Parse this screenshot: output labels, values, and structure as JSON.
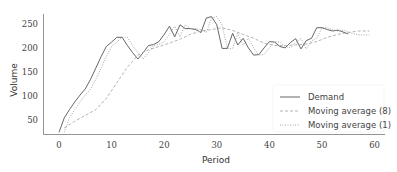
{
  "chart_data": {
    "type": "line",
    "title": "",
    "xlabel": "Period",
    "ylabel": "Volume",
    "xlim": [
      -2,
      62
    ],
    "ylim": [
      15,
      270
    ],
    "xticks": [
      0,
      10,
      20,
      30,
      40,
      50,
      60
    ],
    "yticks": [
      50,
      100,
      150,
      200,
      250
    ],
    "grid": false,
    "legend_position": "lower right",
    "series": [
      {
        "name": "Demand",
        "style": "solid",
        "color": "#555555",
        "x": [
          0,
          1,
          2,
          3,
          4,
          5,
          6,
          7,
          8,
          9,
          10,
          11,
          12,
          13,
          14,
          15,
          16,
          17,
          18,
          19,
          20,
          21,
          22,
          23,
          24,
          25,
          26,
          27,
          28,
          29,
          30,
          31,
          32,
          33,
          34,
          35,
          36,
          37,
          38,
          39,
          40,
          41,
          42,
          43,
          44,
          45,
          46,
          47,
          48,
          49,
          50,
          51,
          52,
          53,
          54,
          55
        ],
        "values": [
          25,
          55,
          72,
          88,
          102,
          115,
          135,
          158,
          182,
          203,
          212,
          222,
          222,
          205,
          190,
          177,
          190,
          205,
          207,
          213,
          228,
          245,
          223,
          248,
          240,
          240,
          238,
          232,
          262,
          265,
          248,
          199,
          199,
          230,
          206,
          220,
          200,
          185,
          186,
          200,
          213,
          212,
          203,
          200,
          211,
          219,
          198,
          215,
          220,
          242,
          242,
          238,
          235,
          237,
          233,
          229
        ]
      },
      {
        "name": "Moving average (8)",
        "style": "dashed",
        "color": "#aaaaaa",
        "x": [
          1,
          3,
          5,
          7,
          9,
          11,
          13,
          15,
          17,
          19,
          21,
          23,
          25,
          27,
          29,
          31,
          33,
          35,
          37,
          39,
          41,
          43,
          45,
          47,
          49,
          51,
          53,
          55,
          57,
          59
        ],
        "values": [
          34,
          48,
          60,
          72,
          95,
          128,
          160,
          185,
          196,
          203,
          210,
          218,
          228,
          235,
          238,
          242,
          236,
          228,
          220,
          210,
          205,
          205,
          206,
          208,
          213,
          222,
          228,
          232,
          235,
          235
        ]
      },
      {
        "name": "Moving average (1)",
        "style": "dotted",
        "color": "#999999",
        "x": [
          1,
          2,
          3,
          4,
          5,
          6,
          7,
          8,
          9,
          10,
          11,
          12,
          13,
          14,
          15,
          16,
          17,
          18,
          19,
          20,
          21,
          22,
          23,
          24,
          25,
          26,
          27,
          28,
          29,
          30,
          31,
          32,
          33,
          34,
          35,
          36,
          37,
          38,
          39,
          40,
          41,
          42,
          43,
          44,
          45,
          46,
          47,
          48,
          49,
          50,
          51,
          52,
          53,
          54,
          55,
          56,
          57,
          58,
          59
        ],
        "values": [
          25,
          55,
          72,
          88,
          102,
          115,
          135,
          158,
          182,
          203,
          212,
          222,
          222,
          205,
          190,
          177,
          190,
          205,
          207,
          213,
          228,
          245,
          223,
          248,
          240,
          240,
          238,
          232,
          262,
          265,
          248,
          199,
          199,
          230,
          206,
          220,
          200,
          185,
          186,
          200,
          213,
          212,
          203,
          200,
          211,
          219,
          198,
          215,
          220,
          242,
          242,
          238,
          235,
          237,
          233,
          229,
          227,
          227,
          227
        ]
      }
    ]
  },
  "axes": {
    "xlabel": "Period",
    "ylabel": "Volume"
  },
  "legend": {
    "items": [
      {
        "label": "Demand",
        "style": "solid"
      },
      {
        "label": "Moving average (8)",
        "style": "dashed"
      },
      {
        "label": "Moving average (1)",
        "style": "dotted"
      }
    ]
  }
}
